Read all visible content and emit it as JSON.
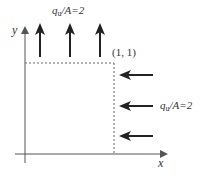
{
  "diagram": {
    "type": "plate-with-boundary-loads",
    "axes": {
      "x_label": "x",
      "y_label": "y"
    },
    "corner_label": "(1, 1)",
    "top_load": {
      "q": "q",
      "sub": "u",
      "rest": "/A=2",
      "direction": "up",
      "arrow_count": 3
    },
    "right_load": {
      "q": "q",
      "sub": "u",
      "rest": "/A=2",
      "direction": "left",
      "arrow_count": 3
    },
    "colors": {
      "axis": "#555555",
      "arrow": "#222222",
      "dashed": "#666666",
      "text": "#333333"
    }
  }
}
